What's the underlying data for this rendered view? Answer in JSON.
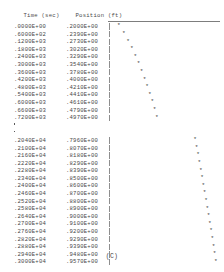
{
  "header": {
    "time_label": "Time (sec)",
    "position_label": "Position (ft)"
  },
  "caption": "(C)",
  "plot": {
    "axis_char": "|",
    "marker_char": "*",
    "x_min": 0.2,
    "x_max": 0.957,
    "plot_left_px": 109,
    "plot_right_px": 218
  },
  "columns": [
    "Time (sec)",
    "Position (ft)"
  ],
  "rows": [
    {
      "time": ".0000E+00",
      "position": ".2000E+00",
      "t": 0,
      "p": 0.2
    },
    {
      "time": ".6000E+02",
      "position": ".2390E+00",
      "t": 60,
      "p": 0.239
    },
    {
      "time": ".1200E+03",
      "position": ".2730E+00",
      "t": 120,
      "p": 0.273
    },
    {
      "time": ".1800E+03",
      "position": ".3020E+00",
      "t": 180,
      "p": 0.302
    },
    {
      "time": ".2400E+03",
      "position": ".3290E+00",
      "t": 240,
      "p": 0.329
    },
    {
      "time": ".3000E+03",
      "position": ".3540E+00",
      "t": 300,
      "p": 0.354
    },
    {
      "time": ".3600E+03",
      "position": ".3780E+00",
      "t": 360,
      "p": 0.378
    },
    {
      "time": ".4200E+03",
      "position": ".4000E+00",
      "t": 420,
      "p": 0.4
    },
    {
      "time": ".4800E+03",
      "position": ".4210E+00",
      "t": 480,
      "p": 0.421
    },
    {
      "time": ".5400E+03",
      "position": ".4410E+00",
      "t": 540,
      "p": 0.441
    },
    {
      "time": ".6000E+03",
      "position": ".4610E+00",
      "t": 600,
      "p": 0.461
    },
    {
      "time": ".6600E+03",
      "position": ".4790E+00",
      "t": 660,
      "p": 0.479
    },
    {
      "time": ".7200E+03",
      "position": ".4970E+00",
      "t": 720,
      "p": 0.497
    },
    {
      "ellipsis": true
    },
    {
      "ellipsis": true
    },
    {
      "time": ".2040E+04",
      "position": ".7960E+00",
      "t": 2040,
      "p": 0.796
    },
    {
      "time": ".2100E+04",
      "position": ".8070E+00",
      "t": 2100,
      "p": 0.807
    },
    {
      "time": ".2160E+04",
      "position": ".8180E+00",
      "t": 2160,
      "p": 0.818
    },
    {
      "time": ".2220E+04",
      "position": ".8290E+00",
      "t": 2220,
      "p": 0.829
    },
    {
      "time": ".2280E+04",
      "position": ".8390E+00",
      "t": 2280,
      "p": 0.839
    },
    {
      "time": ".2340E+04",
      "position": ".8500E+00",
      "t": 2340,
      "p": 0.85
    },
    {
      "time": ".2400E+04",
      "position": ".8600E+00",
      "t": 2400,
      "p": 0.86
    },
    {
      "time": ".2460E+04",
      "position": ".8700E+00",
      "t": 2460,
      "p": 0.87
    },
    {
      "time": ".2520E+04",
      "position": ".8800E+00",
      "t": 2520,
      "p": 0.88
    },
    {
      "time": ".2580E+04",
      "position": ".8900E+00",
      "t": 2580,
      "p": 0.89
    },
    {
      "time": ".2640E+04",
      "position": ".9000E+00",
      "t": 2640,
      "p": 0.9
    },
    {
      "time": ".2700E+04",
      "position": ".9100E+00",
      "t": 2700,
      "p": 0.91
    },
    {
      "time": ".2760E+04",
      "position": ".9200E+00",
      "t": 2760,
      "p": 0.92
    },
    {
      "time": ".2820E+04",
      "position": ".9290E+00",
      "t": 2820,
      "p": 0.929
    },
    {
      "time": ".2880E+04",
      "position": ".9390E+00",
      "t": 2880,
      "p": 0.939
    },
    {
      "time": ".2940E+04",
      "position": ".9480E+00",
      "t": 2940,
      "p": 0.948
    },
    {
      "time": ".3000E+04",
      "position": ".9570E+00",
      "t": 3000,
      "p": 0.957
    }
  ]
}
